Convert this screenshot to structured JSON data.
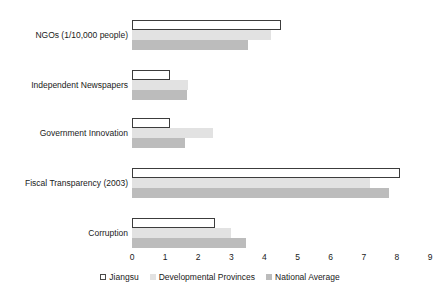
{
  "chart_data": {
    "type": "bar",
    "orientation": "horizontal",
    "title": "",
    "xlabel": "",
    "ylabel": "",
    "xlim": [
      0,
      9
    ],
    "xticks": [
      0,
      1,
      2,
      3,
      4,
      5,
      6,
      7,
      8,
      9
    ],
    "grid": false,
    "legend_position": "bottom",
    "categories": [
      "NGOs (1/10,000 people)",
      "Independent Newspapers",
      "Government Innovation",
      "Fiscal Transparency (2003)",
      "Corruption"
    ],
    "series": [
      {
        "name": "Jiangsu",
        "color": "#ffffff",
        "border": "#3c3c3c",
        "values": [
          4.5,
          1.15,
          1.15,
          8.1,
          2.5
        ]
      },
      {
        "name": "Developmental Provinces",
        "color": "#e2e2e2",
        "values": [
          4.2,
          1.7,
          2.45,
          7.2,
          3.0
        ]
      },
      {
        "name": "National Average",
        "color": "#bcbcbc",
        "values": [
          3.5,
          1.65,
          1.6,
          7.75,
          3.45
        ]
      }
    ]
  },
  "legend": {
    "items": [
      {
        "label": "Jiangsu"
      },
      {
        "label": "Developmental Provinces"
      },
      {
        "label": "National Average"
      }
    ]
  }
}
